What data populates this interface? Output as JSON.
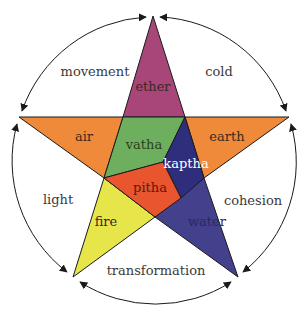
{
  "colors": {
    "ether": "#a8467a",
    "air": "#ee8a3a",
    "earth": "#ee8a3a",
    "fire": "#e6e64a",
    "water": "#43408c",
    "vatha": "#6daf5e",
    "pitha": "#e8552e",
    "kaptha": "#2f2e7d",
    "arc": "#1a1a1a"
  },
  "elements": {
    "ether": "ether",
    "air": "air",
    "earth": "earth",
    "fire": "fire",
    "water": "water"
  },
  "doshas": {
    "vatha": "vatha",
    "pitha": "pitha",
    "kaptha": "kaptha"
  },
  "qualities": {
    "movement": "movement",
    "cold": "cold",
    "light": "light",
    "cohesion": "cohesion",
    "transformation": "transformation"
  }
}
